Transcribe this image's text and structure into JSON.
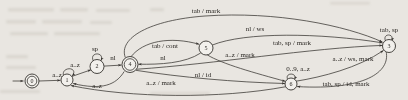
{
  "diagram": {
    "kind": "finite-state-machine",
    "nodes": [
      {
        "id": "0",
        "label": "0",
        "accepting": true,
        "start": true
      },
      {
        "id": "1",
        "label": "1",
        "accepting": false,
        "start": false
      },
      {
        "id": "2",
        "label": "2",
        "accepting": false,
        "start": false
      },
      {
        "id": "4",
        "label": "4",
        "accepting": true,
        "start": false
      },
      {
        "id": "5",
        "label": "5",
        "accepting": false,
        "start": false
      },
      {
        "id": "6",
        "label": "6",
        "accepting": false,
        "start": false
      },
      {
        "id": "3",
        "label": "3",
        "accepting": false,
        "start": false
      }
    ],
    "edges": [
      {
        "from": "start",
        "to": "0",
        "label": ""
      },
      {
        "from": "0",
        "to": "1",
        "label": "a..z"
      },
      {
        "from": "1",
        "to": "1",
        "label": "a..z"
      },
      {
        "from": "1",
        "to": "2",
        "label": ""
      },
      {
        "from": "2",
        "to": "2",
        "label": "sp"
      },
      {
        "from": "2",
        "to": "4",
        "label": "nl"
      },
      {
        "from": "4",
        "to": "5",
        "label": "tab / cont"
      },
      {
        "from": "5",
        "to": "4",
        "label": "nl"
      },
      {
        "from": "4",
        "to": "3",
        "label": "tab / mark"
      },
      {
        "from": "5",
        "to": "3",
        "label": "nl / ws"
      },
      {
        "from": "4",
        "to": "3",
        "label": "tab, sp / mark"
      },
      {
        "from": "5",
        "to": "6",
        "label": "a..z / mark"
      },
      {
        "from": "4",
        "to": "6",
        "label": "nl / id"
      },
      {
        "from": "6",
        "to": "6",
        "label": "0..9, a..z"
      },
      {
        "from": "6",
        "to": "3",
        "label": "a..z / ws, mark"
      },
      {
        "from": "3",
        "to": "6",
        "label": "tab, sp / id, mark"
      },
      {
        "from": "3",
        "to": "3",
        "label": "tab, sp"
      },
      {
        "from": "6",
        "to": "1",
        "label": "a..z / mark"
      },
      {
        "from": "4",
        "to": "1",
        "label": "a..z"
      }
    ],
    "colors": {
      "line": "#36332f",
      "background": "#e9e6e1",
      "node_fill": "#f2f0ec"
    }
  }
}
